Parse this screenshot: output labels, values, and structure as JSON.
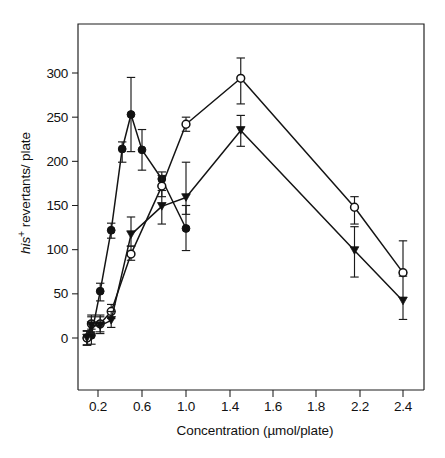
{
  "chart_data": {
    "type": "line",
    "title": "",
    "subtitle": "",
    "xlabel": "Concentration (µmol/plate)",
    "ylabel": "his+ revertants/ plate",
    "ylabel_parts": {
      "italic": "his",
      "superscript": "+",
      "rest": " revertants/ plate"
    },
    "grid": false,
    "legend": "none",
    "xlim": [
      0.0,
      2.6
    ],
    "ylim": [
      -90,
      335
    ],
    "yticks": [
      0,
      50,
      100,
      150,
      200,
      250,
      300
    ],
    "ytick_labels": [
      "0",
      "50",
      "100",
      "150",
      "200",
      "250",
      "300"
    ],
    "xticks": [
      0.2,
      0.6,
      1.0,
      1.4,
      1.6,
      1.8,
      2.2,
      2.4
    ],
    "xtick_labels": [
      "0.2",
      "0.6",
      "1.0",
      "1.4",
      "1.6",
      "1.8",
      "2.2",
      "2.4"
    ],
    "error_bars": true,
    "series": [
      {
        "name": "filled-circle-series",
        "marker": "filled-circle",
        "x": [
          0.1,
          0.14,
          0.22,
          0.32,
          0.42,
          0.5,
          0.6,
          0.78,
          1.0
        ],
        "values": [
          0,
          3,
          53,
          122,
          214,
          253,
          213,
          180,
          124
        ],
        "error_upper": [
          8,
          10,
          62,
          130,
          222,
          295,
          236,
          188,
          150
        ],
        "error_lower": [
          -8,
          -7,
          42,
          113,
          199,
          211,
          190,
          172,
          99
        ]
      },
      {
        "name": "open-circle-series",
        "marker": "open-circle",
        "x": [
          0.1,
          0.14,
          0.22,
          0.32,
          0.5,
          0.78,
          1.0,
          1.45,
          2.15,
          2.4
        ],
        "values": [
          0,
          16,
          16,
          30,
          95,
          172,
          242,
          294,
          148,
          74
        ],
        "error_upper": [
          8,
          26,
          26,
          38,
          104,
          184,
          250,
          317,
          160,
          110
        ],
        "error_lower": [
          -8,
          7,
          7,
          22,
          88,
          160,
          234,
          265,
          129,
          74
        ]
      },
      {
        "name": "filled-triangle-series",
        "marker": "filled-triangle",
        "x": [
          0.1,
          0.14,
          0.22,
          0.32,
          0.5,
          0.78,
          1.0,
          1.45,
          2.15,
          2.4
        ],
        "values": [
          0,
          14,
          14,
          20,
          117,
          149,
          159,
          235,
          99,
          42
        ],
        "error_upper": [
          8,
          24,
          24,
          30,
          137,
          167,
          199,
          252,
          126,
          70
        ],
        "error_lower": [
          -8,
          5,
          5,
          12,
          104,
          129,
          140,
          217,
          69,
          21
        ]
      }
    ]
  },
  "figure": {
    "caption": ""
  }
}
